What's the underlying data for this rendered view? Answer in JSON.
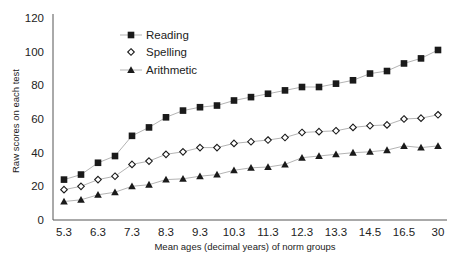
{
  "chart_data": {
    "type": "line",
    "title": "",
    "xlabel": "Mean ages (decimal years) of norm groups",
    "ylabel": "Raw scores on each test",
    "ylim": [
      0,
      120
    ],
    "yticks": [
      0,
      20,
      40,
      60,
      80,
      100,
      120
    ],
    "xtick_labels": [
      "5.3",
      "6.3",
      "7.3",
      "8.3",
      "9.3",
      "10.3",
      "11.3",
      "12.3",
      "13.3",
      "14.5",
      "16.5",
      "30"
    ],
    "n_points": 23,
    "grid": false,
    "legend_position": "upper left (inside plot)",
    "series": [
      {
        "name": "Reading",
        "marker": "filled-square",
        "values": [
          24,
          27,
          34,
          38,
          50,
          55,
          61,
          65,
          67,
          68,
          71,
          73,
          75,
          77,
          79,
          79,
          81,
          83,
          87,
          88.5,
          93,
          96,
          101
        ]
      },
      {
        "name": "Spelling",
        "marker": "open-diamond",
        "values": [
          18,
          20,
          24,
          26,
          33,
          35,
          39,
          40.5,
          43,
          43,
          45.5,
          46.5,
          47.5,
          49,
          52,
          52.5,
          53,
          55,
          56,
          56.5,
          60,
          60.5,
          62.5
        ]
      },
      {
        "name": "Arithmetic",
        "marker": "filled-triangle",
        "values": [
          11,
          12,
          15,
          16.5,
          20,
          21,
          24,
          24.5,
          26,
          27,
          29.5,
          31,
          31.5,
          33,
          37,
          38,
          39,
          40,
          40.5,
          41.5,
          44,
          43,
          44
        ]
      }
    ]
  },
  "colors": {
    "axis": "#555555",
    "line": "#aaaaaa",
    "marker": "#1a1a1a",
    "text": "#222222"
  }
}
